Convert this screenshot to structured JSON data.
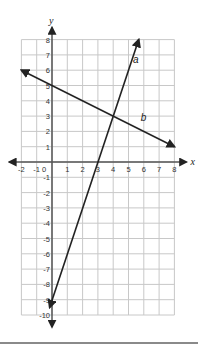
{
  "chart_data": {
    "type": "line",
    "title": "",
    "xlabel": "x",
    "ylabel": "y",
    "xlim": [
      -2,
      8
    ],
    "ylim": [
      -10,
      8
    ],
    "grid": true,
    "x_ticks": [
      -2,
      -1,
      0,
      1,
      2,
      3,
      4,
      5,
      6,
      7,
      8
    ],
    "y_ticks": [
      -10,
      -9,
      -8,
      -7,
      -6,
      -5,
      -4,
      -3,
      -2,
      -1,
      1,
      2,
      3,
      4,
      5,
      6,
      7,
      8
    ],
    "series": [
      {
        "name": "a",
        "equation": "y = 3x - 9",
        "points": [
          [
            -0.15,
            -9.5
          ],
          [
            5.67,
            8
          ]
        ],
        "label_pos": [
          5.3,
          6.5
        ]
      },
      {
        "name": "b",
        "equation": "y = -0.5x + 5",
        "points": [
          [
            -2,
            6
          ],
          [
            8,
            1
          ]
        ],
        "label_pos": [
          5.8,
          2.7
        ]
      }
    ],
    "intersection": [
      4,
      3
    ]
  },
  "colors": {
    "grid": "#c8c8c8",
    "axis": "#555555",
    "line": "#222222",
    "bottom_rule": "#8a8a8a"
  }
}
